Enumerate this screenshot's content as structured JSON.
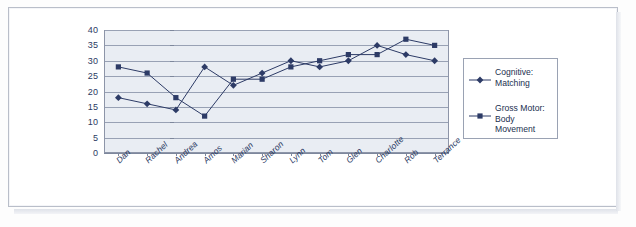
{
  "chart_data": {
    "type": "line",
    "title": "",
    "xlabel": "",
    "ylabel": "",
    "ylim": [
      0,
      40
    ],
    "yticks": [
      0,
      5,
      10,
      15,
      20,
      25,
      30,
      35,
      40
    ],
    "grid": true,
    "legend_position": "right",
    "categories": [
      "Dan",
      "Rachel",
      "Andrea",
      "Amos",
      "Marian",
      "Sharon",
      "Lynn",
      "Tom",
      "Glen",
      "Charlotte",
      "Rob",
      "Terrance"
    ],
    "series": [
      {
        "name": "Cognitive: Matching",
        "marker": "diamond",
        "color": "#2d3b66",
        "values": [
          18,
          16,
          14,
          28,
          22,
          26,
          30,
          28,
          30,
          35,
          32,
          30
        ]
      },
      {
        "name": "Gross Motor: Body Movement",
        "marker": "square",
        "color": "#2d3b66",
        "values": [
          28,
          26,
          18,
          12,
          24,
          24,
          28,
          30,
          32,
          32,
          37,
          35
        ]
      }
    ]
  },
  "legend": {
    "entries": [
      {
        "label": "Cognitive:\nMatching",
        "marker": "diamond"
      },
      {
        "label": "Gross Motor:\nBody\nMovement",
        "marker": "square"
      }
    ]
  },
  "axis": {
    "y_tick_labels": [
      "40",
      "35",
      "30",
      "25",
      "20",
      "15",
      "10",
      "5",
      "0"
    ],
    "x_tick_labels": [
      "Dan",
      "Rachel",
      "Andrea",
      "Amos",
      "Marian",
      "Sharon",
      "Lynn",
      "Tom",
      "Glen",
      "Charlotte",
      "Rob",
      "Terrance"
    ]
  },
  "colors": {
    "series_ink": "#2d3b66",
    "plot_background": "#e9edf3",
    "gridline": "#98a1b4",
    "axis": "#7d879c",
    "page": "#ffffff"
  }
}
